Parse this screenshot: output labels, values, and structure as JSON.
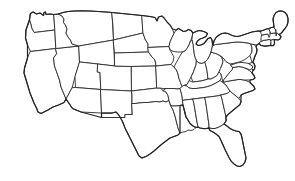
{
  "figure": {
    "kind": "outline-map",
    "region": "Contiguous 48 states",
    "projection_look": "Albers-like conic",
    "background_color": "#ffffff",
    "border_color": "#2b2b2b",
    "outer_border_color": "#222222",
    "fill_color": "#ffffff",
    "has_labels": false,
    "has_legend": false,
    "has_title_text": false,
    "line_style": "thin solid",
    "width_px": 295,
    "height_px": 181
  },
  "map": {
    "feature_count": 49,
    "notes": "State boundary lines only; no text, no shading, no legend.",
    "states": [
      {
        "code": "WA",
        "name": "Washington"
      },
      {
        "code": "OR",
        "name": "Oregon"
      },
      {
        "code": "CA",
        "name": "California"
      },
      {
        "code": "NV",
        "name": "Nevada"
      },
      {
        "code": "ID",
        "name": "Idaho"
      },
      {
        "code": "MT",
        "name": "Montana"
      },
      {
        "code": "WY",
        "name": "Wyoming"
      },
      {
        "code": "UT",
        "name": "Utah"
      },
      {
        "code": "AZ",
        "name": "Arizona"
      },
      {
        "code": "CO",
        "name": "Colorado"
      },
      {
        "code": "NM",
        "name": "New Mexico"
      },
      {
        "code": "ND",
        "name": "North Dakota"
      },
      {
        "code": "SD",
        "name": "South Dakota"
      },
      {
        "code": "NE",
        "name": "Nebraska"
      },
      {
        "code": "KS",
        "name": "Kansas"
      },
      {
        "code": "OK",
        "name": "Oklahoma"
      },
      {
        "code": "TX",
        "name": "Texas"
      },
      {
        "code": "MN",
        "name": "Minnesota"
      },
      {
        "code": "IA",
        "name": "Iowa"
      },
      {
        "code": "MO",
        "name": "Missouri"
      },
      {
        "code": "AR",
        "name": "Arkansas"
      },
      {
        "code": "LA",
        "name": "Louisiana"
      },
      {
        "code": "WI",
        "name": "Wisconsin"
      },
      {
        "code": "IL",
        "name": "Illinois"
      },
      {
        "code": "MI",
        "name": "Michigan"
      },
      {
        "code": "IN",
        "name": "Indiana"
      },
      {
        "code": "OH",
        "name": "Ohio"
      },
      {
        "code": "KY",
        "name": "Kentucky"
      },
      {
        "code": "TN",
        "name": "Tennessee"
      },
      {
        "code": "MS",
        "name": "Mississippi"
      },
      {
        "code": "AL",
        "name": "Alabama"
      },
      {
        "code": "GA",
        "name": "Georgia"
      },
      {
        "code": "FL",
        "name": "Florida"
      },
      {
        "code": "SC",
        "name": "South Carolina"
      },
      {
        "code": "NC",
        "name": "North Carolina"
      },
      {
        "code": "VA",
        "name": "Virginia"
      },
      {
        "code": "WV",
        "name": "West Virginia"
      },
      {
        "code": "MD",
        "name": "Maryland"
      },
      {
        "code": "DE",
        "name": "Delaware"
      },
      {
        "code": "PA",
        "name": "Pennsylvania"
      },
      {
        "code": "NJ",
        "name": "New Jersey"
      },
      {
        "code": "NY",
        "name": "New York"
      },
      {
        "code": "CT",
        "name": "Connecticut"
      },
      {
        "code": "RI",
        "name": "Rhode Island"
      },
      {
        "code": "MA",
        "name": "Massachusetts"
      },
      {
        "code": "VT",
        "name": "Vermont"
      },
      {
        "code": "NH",
        "name": "New Hampshire"
      },
      {
        "code": "ME",
        "name": "Maine"
      }
    ]
  }
}
